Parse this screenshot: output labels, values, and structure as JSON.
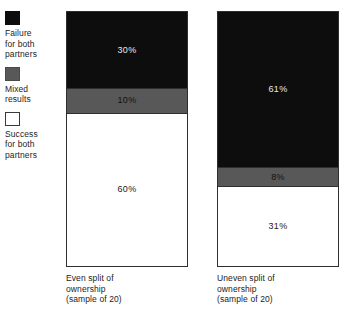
{
  "legend": {
    "items": [
      {
        "swatch": "black-filled-square-icon",
        "label": "Failure\nfor both\npartners",
        "color": "#0d0d0d"
      },
      {
        "swatch": "gray-filled-square-icon",
        "label": "Mixed\nresults",
        "color": "#585858"
      },
      {
        "swatch": "white-outlined-square-icon",
        "label": "Success\nfor both\npartners",
        "color": "#ffffff"
      }
    ]
  },
  "chart_data": {
    "type": "bar",
    "title": "",
    "subtitle": "",
    "xlabel": "",
    "ylabel": "",
    "ylim": [
      0,
      100
    ],
    "grid": false,
    "legend_position": "left",
    "stacked": true,
    "stack_order_top_to_bottom": [
      "Failure for both partners",
      "Mixed results",
      "Success for both partners"
    ],
    "categories": [
      "Even split of\nownership\n(sample of 20)",
      "Uneven split of\nownership\n(sample of 20)"
    ],
    "series": [
      {
        "name": "Failure for both partners",
        "color": "#0d0d0d",
        "values": [
          30,
          61
        ]
      },
      {
        "name": "Mixed results",
        "color": "#585858",
        "values": [
          10,
          8
        ]
      },
      {
        "name": "Success for both partners",
        "color": "#ffffff",
        "values": [
          60,
          31
        ]
      }
    ],
    "bars": [
      {
        "caption": "Even split of\nownership\n(sample of 20)",
        "sample_size": 20,
        "segments": [
          {
            "name": "Failure for both partners",
            "value": 30,
            "label": "30%",
            "color": "#0d0d0d"
          },
          {
            "name": "Mixed results",
            "value": 10,
            "label": "10%",
            "color": "#585858"
          },
          {
            "name": "Success for both partners",
            "value": 60,
            "label": "60%",
            "color": "#ffffff"
          }
        ]
      },
      {
        "caption": "Uneven split of\nownership\n(sample of 20)",
        "sample_size": 20,
        "segments": [
          {
            "name": "Failure for both partners",
            "value": 61,
            "label": "61%",
            "color": "#0d0d0d"
          },
          {
            "name": "Mixed results",
            "value": 8,
            "label": "8%",
            "color": "#585858"
          },
          {
            "name": "Success for both partners",
            "value": 31,
            "label": "31%",
            "color": "#ffffff"
          }
        ]
      }
    ]
  }
}
